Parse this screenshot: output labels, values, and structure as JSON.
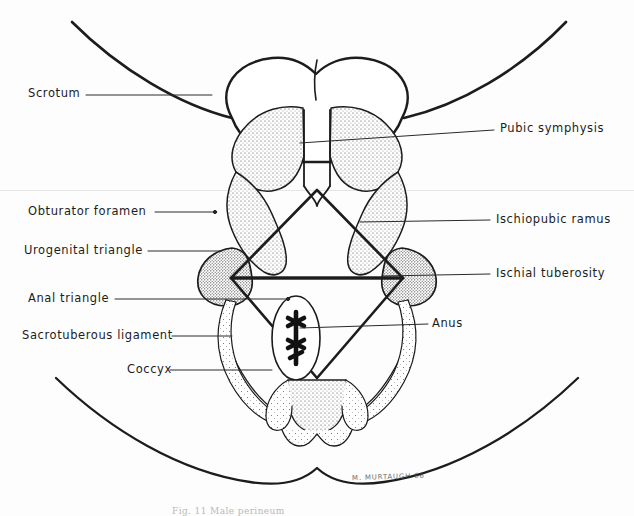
{
  "figure": {
    "caption": "Fig. 11  Male perineum",
    "signature": "M. MURTAUGH  66",
    "background_color": "#fdfdfd",
    "ink_color": "#1c1c1c",
    "stipple_color": "#3a3a3a"
  },
  "labels_left": [
    {
      "text": "Scrotum",
      "x": 28,
      "y": 88,
      "leader_to_x": 212,
      "leader_to_y": 98
    },
    {
      "text": "Obturator  foramen",
      "x": 28,
      "y": 208,
      "leader_to_x": 215,
      "leader_to_y": 215
    },
    {
      "text": "Urogenital  triangle",
      "x": 24,
      "y": 247,
      "leader_to_x": 222,
      "leader_to_y": 253
    },
    {
      "text": "Anal triangle",
      "x": 28,
      "y": 296,
      "leader_to_x": 288,
      "leader_to_y": 300
    },
    {
      "text": "Sacrotuberous  ligament",
      "x": 22,
      "y": 334,
      "leader_to_x": 232,
      "leader_to_y": 338
    },
    {
      "text": "Coccyx",
      "x": 127,
      "y": 372,
      "leader_to_x": 272,
      "leader_to_y": 372
    }
  ],
  "labels_right": [
    {
      "text": "Pubic  symphysis",
      "x": 500,
      "y": 126,
      "leader_to_x": 300,
      "leader_to_y": 143
    },
    {
      "text": "Ischiopubic  ramus",
      "x": 496,
      "y": 216,
      "leader_to_x": 360,
      "leader_to_y": 222
    },
    {
      "text": "Ischial  tuberosity",
      "x": 496,
      "y": 270,
      "leader_to_x": 382,
      "leader_to_y": 275
    },
    {
      "text": "Anus",
      "x": 432,
      "y": 320,
      "leader_to_x": 300,
      "leader_to_y": 328
    }
  ],
  "structures": [
    "scrotum",
    "pubic-symphysis",
    "ischiopubic-ramus",
    "obturator-foramen",
    "ischial-tuberosity",
    "urogenital-triangle",
    "anal-triangle",
    "sacrotuberous-ligament",
    "anus",
    "coccyx",
    "thigh-outline",
    "gluteal-fold"
  ]
}
